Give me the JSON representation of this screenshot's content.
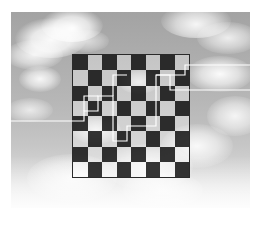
{
  "figure": {
    "canvas": {
      "width": 261,
      "height": 225,
      "background": "#ffffff"
    }
  },
  "photo": {
    "name": "cloudy-sky-photograph",
    "alt_text": "Grayscale photograph of a cloudy sky",
    "left": 11,
    "top": 12,
    "width": 239,
    "height": 196,
    "palette": {
      "sky_top": "#a3a3a3",
      "sky_mid": "#bdbdbd",
      "sky_bottom": "#f3f3f3",
      "cloud_white": "#ffffff"
    },
    "clouds": [
      {
        "name": "cloud-upper-left",
        "x": 4,
        "y": 6,
        "w": 72,
        "h": 40,
        "opacity": 0.95
      },
      {
        "name": "cloud-top-left-peak",
        "x": 30,
        "y": -4,
        "w": 62,
        "h": 34,
        "opacity": 0.98
      },
      {
        "name": "cloud-left-mid-upper",
        "x": -6,
        "y": 28,
        "w": 58,
        "h": 30,
        "opacity": 0.85
      },
      {
        "name": "cloud-left-mid",
        "x": 8,
        "y": 54,
        "w": 42,
        "h": 26,
        "opacity": 0.9
      },
      {
        "name": "cloud-left-lower",
        "x": -4,
        "y": 86,
        "w": 46,
        "h": 24,
        "opacity": 0.7
      },
      {
        "name": "cloud-top-right",
        "x": 150,
        "y": -8,
        "w": 70,
        "h": 34,
        "opacity": 0.9
      },
      {
        "name": "cloud-right-upper",
        "x": 186,
        "y": 10,
        "w": 62,
        "h": 32,
        "opacity": 0.8
      },
      {
        "name": "cloud-right-mid-upper",
        "x": 176,
        "y": 44,
        "w": 66,
        "h": 36,
        "opacity": 0.95
      },
      {
        "name": "cloud-right-mid",
        "x": 196,
        "y": 84,
        "w": 56,
        "h": 40,
        "opacity": 0.85
      },
      {
        "name": "cloud-right-lower",
        "x": 150,
        "y": 112,
        "w": 72,
        "h": 44,
        "opacity": 0.9
      },
      {
        "name": "cloud-bottom-center",
        "x": 92,
        "y": 132,
        "w": 90,
        "h": 46,
        "opacity": 0.8
      },
      {
        "name": "cloud-bottom-left",
        "x": 16,
        "y": 142,
        "w": 90,
        "h": 48,
        "opacity": 0.85
      },
      {
        "name": "cloud-center-wisp",
        "x": 60,
        "y": 104,
        "w": 50,
        "h": 28,
        "opacity": 0.8
      },
      {
        "name": "cloud-center-upper-wisp",
        "x": 108,
        "y": 58,
        "w": 40,
        "h": 24,
        "opacity": 0.7
      },
      {
        "name": "cloud-top-center-wisp",
        "x": 54,
        "y": 18,
        "w": 44,
        "h": 22,
        "opacity": 0.6
      },
      {
        "name": "cloud-bottom-haze",
        "x": 112,
        "y": 160,
        "w": 80,
        "h": 36,
        "opacity": 0.75
      }
    ]
  },
  "checkerboard": {
    "name": "checkerboard-overlay",
    "rows": 8,
    "columns": 8,
    "left": 73,
    "top": 55,
    "width": 116,
    "height": 122,
    "cell_width": 14.5,
    "cell_height": 15.25,
    "border_color": "#2a2a2a",
    "dark_color": "rgba(20,20,20,0.86)",
    "light_color": "rgba(255,255,255,0.30)",
    "top_left_square": "dark",
    "squares": [
      [
        "dark",
        "light",
        "dark",
        "light",
        "dark",
        "light",
        "dark",
        "light"
      ],
      [
        "light",
        "dark",
        "light",
        "dark",
        "light",
        "dark",
        "light",
        "dark"
      ],
      [
        "dark",
        "light",
        "dark",
        "light",
        "dark",
        "light",
        "dark",
        "light"
      ],
      [
        "light",
        "dark",
        "light",
        "dark",
        "light",
        "dark",
        "light",
        "dark"
      ],
      [
        "dark",
        "light",
        "dark",
        "light",
        "dark",
        "light",
        "dark",
        "light"
      ],
      [
        "light",
        "dark",
        "light",
        "dark",
        "light",
        "dark",
        "light",
        "dark"
      ],
      [
        "dark",
        "light",
        "dark",
        "light",
        "dark",
        "light",
        "dark",
        "light"
      ],
      [
        "light",
        "dark",
        "light",
        "dark",
        "light",
        "dark",
        "light",
        "dark"
      ]
    ]
  },
  "path_overlay": {
    "name": "white-polyline-overlay",
    "stroke_color": "#ffffff",
    "stroke_width": 1.15,
    "polylines": [
      {
        "name": "polyline-left-branch",
        "points": "11,121 84,121 84,111 98,111 98,96 113,96 113,141 127,141 127,126 156,126 156,75 170,75 170,90 250,90"
      },
      {
        "name": "polyline-right-branch",
        "points": "156,75 185,75 185,65 250,65"
      },
      {
        "name": "polyline-left-stub",
        "points": "84,111 84,96 98,96"
      },
      {
        "name": "polyline-center-vertical",
        "points": "113,96 113,75 127,75"
      }
    ]
  }
}
